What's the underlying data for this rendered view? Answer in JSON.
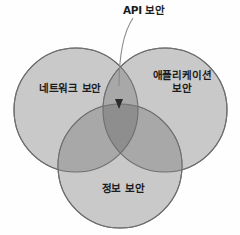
{
  "diagram": {
    "type": "venn",
    "title": "",
    "background_color": "#fefefe",
    "fill_color": "#c9c9c9",
    "stroke_color": "#6e6e6e",
    "text_color": "#1c1c1c",
    "sets": [
      {
        "id": "network",
        "label": "네트워크 보안",
        "position": "left"
      },
      {
        "id": "application",
        "label": "애플리케이션\n보안",
        "position": "right"
      },
      {
        "id": "information",
        "label": "정보 보안",
        "position": "bottom"
      }
    ],
    "callout": {
      "label": "API 보안",
      "points_to": "triple-intersection"
    }
  }
}
